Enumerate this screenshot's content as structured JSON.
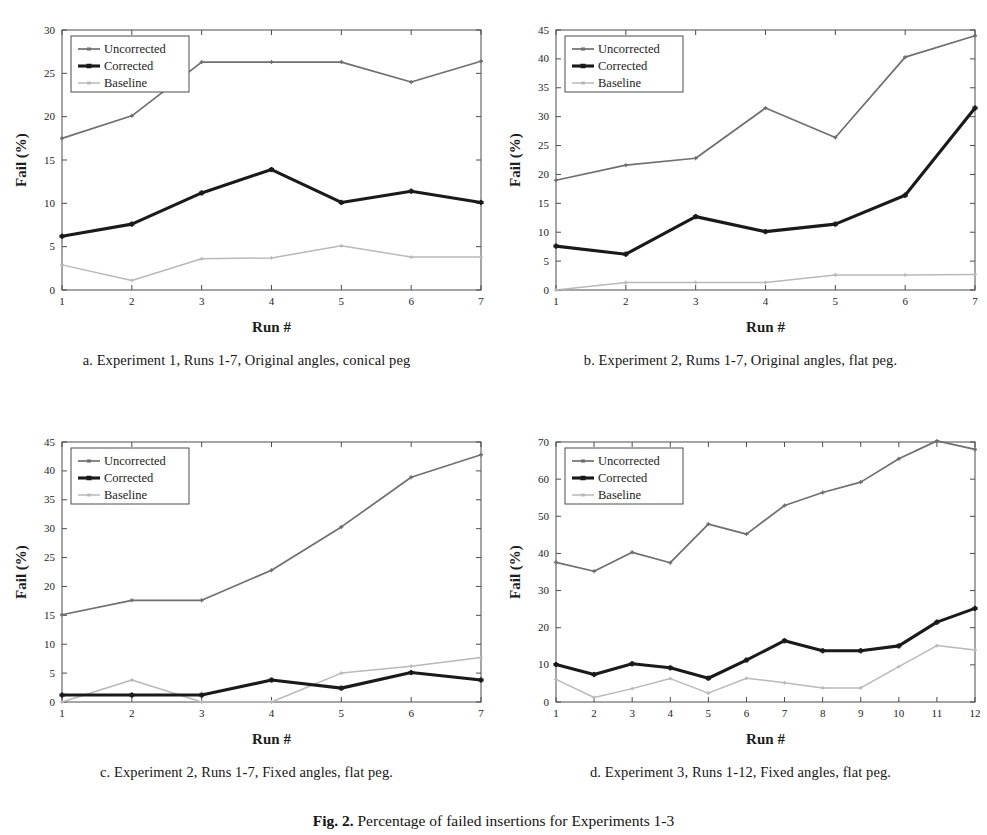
{
  "figure": {
    "caption_label": "Fig. 2.",
    "caption_text": "Percentage of failed insertions for Experiments 1-3"
  },
  "series_names": {
    "uncorrected": "Uncorrected",
    "corrected": "Corrected",
    "baseline": "Baseline"
  },
  "colors": {
    "uncorrected": "#6f6f6f",
    "corrected": "#1a1a1a",
    "baseline": "#b9b9b9",
    "axis": "#4d4d4d",
    "text": "#1d1d1d",
    "background": "#ffffff"
  },
  "panels": [
    {
      "id": "a",
      "caption": "a.  Experiment 1, Runs 1-7, Original angles, conical peg",
      "chart_data": {
        "type": "line",
        "title": "",
        "xlabel": "Run #",
        "ylabel": "Fail (%)",
        "x": [
          1,
          2,
          3,
          4,
          5,
          6,
          7
        ],
        "xticklabels": [
          "1",
          "2",
          "3",
          "4",
          "5",
          "6",
          "7"
        ],
        "xlim": [
          1,
          7
        ],
        "ylim": [
          0,
          30
        ],
        "yticks": [
          0,
          5,
          10,
          15,
          20,
          25,
          30
        ],
        "yticklabels": [
          "0",
          "5",
          "10",
          "15",
          "20",
          "25",
          "30"
        ],
        "grid": false,
        "legend_position": "top-left",
        "series": [
          {
            "name": "Uncorrected",
            "values": [
              17.5,
              20.1,
              26.3,
              26.3,
              26.3,
              24.0,
              26.4
            ]
          },
          {
            "name": "Corrected",
            "values": [
              6.2,
              7.6,
              11.2,
              13.9,
              10.1,
              11.4,
              10.1
            ]
          },
          {
            "name": "Baseline",
            "values": [
              2.9,
              1.1,
              3.6,
              3.7,
              5.1,
              3.8,
              3.8
            ]
          }
        ]
      }
    },
    {
      "id": "b",
      "caption": "b.  Experiment 2, Rums 1-7, Original angles, flat peg.",
      "chart_data": {
        "type": "line",
        "title": "",
        "xlabel": "Run #",
        "ylabel": "Fail (%)",
        "x": [
          1,
          2,
          3,
          4,
          5,
          6,
          7
        ],
        "xticklabels": [
          "1",
          "2",
          "3",
          "4",
          "5",
          "6",
          "7"
        ],
        "xlim": [
          1,
          7
        ],
        "ylim": [
          0,
          45
        ],
        "yticks": [
          0,
          5,
          10,
          15,
          20,
          25,
          30,
          35,
          40,
          45
        ],
        "yticklabels": [
          "0",
          "5",
          "10",
          "15",
          "20",
          "25",
          "30",
          "35",
          "40",
          "45"
        ],
        "grid": false,
        "legend_position": "top-left",
        "series": [
          {
            "name": "Uncorrected",
            "values": [
              19.0,
              21.6,
              22.8,
              31.5,
              26.4,
              40.3,
              44.0
            ]
          },
          {
            "name": "Corrected",
            "values": [
              7.6,
              6.2,
              12.7,
              10.1,
              11.4,
              16.4,
              31.5
            ]
          },
          {
            "name": "Baseline",
            "values": [
              0.0,
              1.3,
              1.3,
              1.3,
              2.6,
              2.6,
              2.7
            ]
          }
        ]
      }
    },
    {
      "id": "c",
      "caption": "c.  Experiment 2, Runs 1-7, Fixed angles, flat peg.",
      "chart_data": {
        "type": "line",
        "title": "",
        "xlabel": "Run #",
        "ylabel": "Fail (%)",
        "x": [
          1,
          2,
          3,
          4,
          5,
          6,
          7
        ],
        "xticklabels": [
          "1",
          "2",
          "3",
          "4",
          "5",
          "6",
          "7"
        ],
        "xlim": [
          1,
          7
        ],
        "ylim": [
          0,
          45
        ],
        "yticks": [
          0,
          5,
          10,
          15,
          20,
          25,
          30,
          35,
          40,
          45
        ],
        "yticklabels": [
          "0",
          "5",
          "10",
          "15",
          "20",
          "25",
          "30",
          "35",
          "40",
          "45"
        ],
        "grid": false,
        "legend_position": "top-left",
        "series": [
          {
            "name": "Uncorrected",
            "values": [
              15.1,
              17.6,
              17.6,
              22.8,
              30.3,
              38.9,
              42.8
            ]
          },
          {
            "name": "Corrected",
            "values": [
              1.2,
              1.2,
              1.2,
              3.8,
              2.4,
              5.1,
              3.8
            ]
          },
          {
            "name": "Baseline",
            "values": [
              0.0,
              3.8,
              0.0,
              0.0,
              5.0,
              6.2,
              7.7
            ]
          }
        ]
      }
    },
    {
      "id": "d",
      "caption": "d.  Experiment 3, Runs 1-12, Fixed angles, flat peg.",
      "chart_data": {
        "type": "line",
        "title": "",
        "xlabel": "Run #",
        "ylabel": "Fail  (%)",
        "x": [
          1,
          2,
          3,
          4,
          5,
          6,
          7,
          8,
          9,
          10,
          11,
          12
        ],
        "xticklabels": [
          "1",
          "2",
          "3",
          "4",
          "5",
          "6",
          "7",
          "8",
          "9",
          "10",
          "11",
          "12"
        ],
        "xlim": [
          1,
          12
        ],
        "ylim": [
          0,
          70
        ],
        "yticks": [
          0,
          10,
          20,
          30,
          40,
          50,
          60,
          70
        ],
        "yticklabels": [
          "0",
          "10",
          "20",
          "30",
          "40",
          "50",
          "60",
          "70"
        ],
        "grid": false,
        "legend_position": "top-left",
        "series": [
          {
            "name": "Uncorrected",
            "values": [
              37.6,
              35.2,
              40.3,
              37.5,
              47.9,
              45.2,
              52.9,
              56.4,
              59.2,
              65.5,
              70.3,
              68.0
            ]
          },
          {
            "name": "Corrected",
            "values": [
              10.1,
              7.4,
              10.3,
              9.2,
              6.4,
              11.3,
              16.5,
              13.8,
              13.8,
              15.1,
              21.5,
              25.2
            ]
          },
          {
            "name": "Baseline",
            "values": [
              6.1,
              1.2,
              3.6,
              6.3,
              2.4,
              6.4,
              5.2,
              3.8,
              3.8,
              9.5,
              15.2,
              14.0
            ]
          }
        ]
      }
    }
  ]
}
